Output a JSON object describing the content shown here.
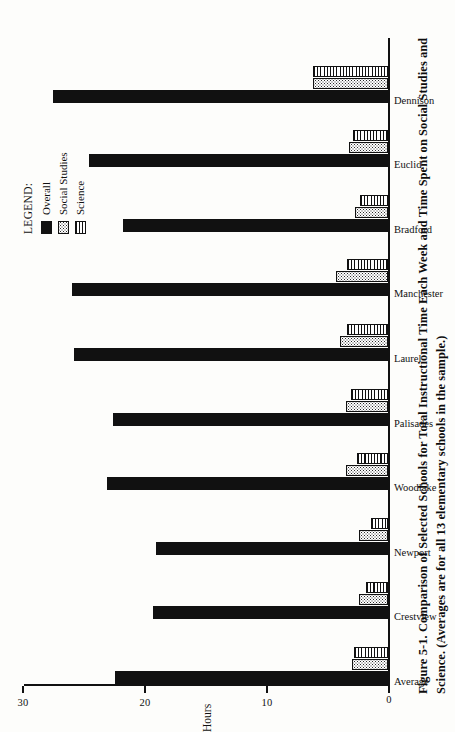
{
  "figure": {
    "caption_line1": "Figure 5-1. Comparison of Selected Schools for Total Instructional Time Each Week and",
    "caption_line2": "Science. (Averages are for all 13 elementary schools in the sample.)",
    "caption_full": "Figure 5-1. Comparison of Selected Schools for Total Instructional Time Each Week and Time Spent on Social Studies and Science. (Averages are for all 13 elementary schools in the sample.)"
  },
  "legend": {
    "title": "LEGEND:",
    "items": [
      {
        "label": "Overall",
        "key": "overall",
        "color": "#111111"
      },
      {
        "label": "Social Studies",
        "key": "social",
        "color": "#2a2a2a"
      },
      {
        "label": "Science",
        "key": "science",
        "color": "#111111"
      }
    ]
  },
  "axis": {
    "title": "Hours",
    "ticks": [
      "0",
      "10",
      "20",
      "30"
    ]
  },
  "chart_data": {
    "type": "bar",
    "title": "Comparison of Selected Schools for Total Instructional Time Each Week and Time Spent on Social Studies and Science.",
    "orientation": "horizontal",
    "xlabel": "",
    "ylabel": "Hours",
    "ylim": [
      0,
      30
    ],
    "yticks": [
      0,
      10,
      20,
      30
    ],
    "grid": false,
    "legend_position": "upper-left",
    "categories": [
      "Average",
      "Crestview",
      "Newport",
      "Woodlake",
      "Palisades",
      "Laurel",
      "Manchester",
      "Bradford",
      "Euclid",
      "Dennison"
    ],
    "series": [
      {
        "name": "Overall",
        "values": [
          22.6,
          19.5,
          19.2,
          23.3,
          22.8,
          26.0,
          26.2,
          22.0,
          24.8,
          27.8
        ]
      },
      {
        "name": "Social Studies",
        "values": [
          3.0,
          2.4,
          2.4,
          3.5,
          3.5,
          4.0,
          4.3,
          2.7,
          3.2,
          6.2
        ]
      },
      {
        "name": "Science",
        "values": [
          2.8,
          1.8,
          1.4,
          2.6,
          3.1,
          3.4,
          3.4,
          2.3,
          2.9,
          6.2
        ]
      }
    ]
  }
}
